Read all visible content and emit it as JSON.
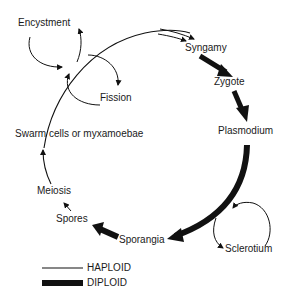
{
  "diagram": {
    "type": "life-cycle",
    "stages": {
      "encystment": "Encystment",
      "fission": "Fission",
      "swarm_cells": "Swarm cells or myxamoebae",
      "meiosis": "Meiosis",
      "spores": "Spores",
      "sporangia": "Sporangia",
      "syngamy": "Syngamy",
      "zygote": "Zygote",
      "plasmodium": "Plasmodium",
      "sclerotium": "Sclerotium"
    },
    "legend": {
      "haploid": "HAPLOID",
      "diploid": "DIPLOID"
    },
    "colors": {
      "line": "#111111",
      "background": "#ffffff"
    }
  }
}
